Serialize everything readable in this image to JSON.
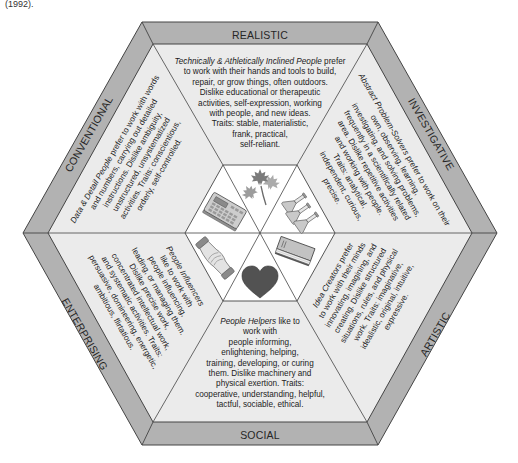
{
  "caption_fragment": "(1992).",
  "colors": {
    "band": "#b2b2b2",
    "inner": "#ebebeb",
    "center": "#ffffff",
    "outline": "#444444",
    "heart": "#525252"
  },
  "sectors": [
    {
      "id": "realistic",
      "label": "REALISTIC",
      "icon": "maple-leaf-icon",
      "lead_italic": "Technically & Athletically Inclined People",
      "lead_rest": " prefer",
      "lines": [
        "to work with their hands and tools to build,",
        "repair, or grow things, often outdoors.",
        "Dislike educational or therapeutic",
        "activities, self-expression, working",
        "with people, and new ideas.",
        "Traits: stable, materialistic,",
        "frank, practical,",
        "self-reliant."
      ]
    },
    {
      "id": "investigative",
      "label": "INVESTIGATIVE",
      "icon": "flasks-icon",
      "lead_italic": "Abstract Problem-Solvers",
      "lead_rest": " prefer to work on their",
      "lines": [
        "own, observing, learning,",
        "investigating, and solving problems,",
        "frequently in a scientifically related",
        "area. Dislike repetitive activities",
        "and working with people.",
        "Traits: analytical,",
        "independent, curious,",
        "precise."
      ]
    },
    {
      "id": "artistic",
      "label": "ARTISTIC",
      "icon": "book-icon",
      "lead_italic": "Idea Creators",
      "lead_rest": " prefer",
      "lines": [
        "to work with their minds",
        "innovating, imagining, and",
        "creating. Dislike structured",
        "situations, rules, and physical",
        "work. Traits: imaginative,",
        "idealistic, original, intuitive,",
        "expressive."
      ]
    },
    {
      "id": "social",
      "label": "SOCIAL",
      "icon": "heart-icon",
      "lead_italic": "People Helpers",
      "lead_rest": " like to",
      "lines": [
        "work with",
        "people informing,",
        "enlightening, helping,",
        "training, developing, or curing",
        "them. Dislike machinery and",
        "physical exertion. Traits:",
        "cooperative, understanding, helpful,",
        "tactful, sociable, ethical."
      ]
    },
    {
      "id": "enterprising",
      "label": "ENTERPRISING",
      "icon": "handshake-icon",
      "lead_italic": "People Influencers",
      "lead_rest": "",
      "lines": [
        "like to work with",
        "people influencing,",
        "leading, or managing them.",
        "Dislike precise work,",
        "concentrated intellectual work,",
        "and systematic activities. Traits:",
        "persuasive, domineering, energetic,",
        "ambitious, flirtatious."
      ]
    },
    {
      "id": "conventional",
      "label": "CONVENTIONAL",
      "icon": "calculator-icon",
      "lead_italic": "Data & Detail People",
      "lead_rest": " prefer to work with words",
      "lines": [
        "and numbers, carrying out detailed",
        "instructions. Dislike ambiguity,",
        "unstructured, unsystematized",
        "activities. Traits: conscientious,",
        "orderly, self-controlled."
      ]
    }
  ]
}
